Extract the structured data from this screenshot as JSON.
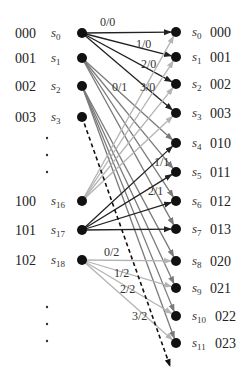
{
  "diagram": {
    "type": "trellis",
    "colors": {
      "node": "#111111",
      "black_edge": "#222222",
      "gray_edge": "#7a7a7a",
      "light_edge": "#b4b4b4",
      "dashed": "#111111"
    },
    "left_nodes": [
      {
        "code": "000",
        "name": "s",
        "sub": "0",
        "x": 82,
        "y": 33
      },
      {
        "code": "001",
        "name": "s",
        "sub": "1",
        "x": 82,
        "y": 58
      },
      {
        "code": "002",
        "name": "s",
        "sub": "2",
        "x": 82,
        "y": 86
      },
      {
        "code": "003",
        "name": "s",
        "sub": "3",
        "x": 82,
        "y": 117
      },
      {
        "code": "100",
        "name": "s",
        "sub": "16",
        "x": 82,
        "y": 201
      },
      {
        "code": "101",
        "name": "s",
        "sub": "17",
        "x": 82,
        "y": 230
      },
      {
        "code": "102",
        "name": "s",
        "sub": "18",
        "x": 82,
        "y": 260
      }
    ],
    "right_nodes": [
      {
        "code": "000",
        "name": "s",
        "sub": "0",
        "x": 176,
        "y": 32
      },
      {
        "code": "001",
        "name": "s",
        "sub": "1",
        "x": 176,
        "y": 57
      },
      {
        "code": "002",
        "name": "s",
        "sub": "2",
        "x": 176,
        "y": 84
      },
      {
        "code": "003",
        "name": "s",
        "sub": "3",
        "x": 176,
        "y": 113
      },
      {
        "code": "010",
        "name": "s",
        "sub": "4",
        "x": 176,
        "y": 143
      },
      {
        "code": "011",
        "name": "s",
        "sub": "5",
        "x": 176,
        "y": 172
      },
      {
        "code": "012",
        "name": "s",
        "sub": "6",
        "x": 176,
        "y": 201
      },
      {
        "code": "013",
        "name": "s",
        "sub": "7",
        "x": 176,
        "y": 229
      },
      {
        "code": "020",
        "name": "s",
        "sub": "8",
        "x": 176,
        "y": 261
      },
      {
        "code": "021",
        "name": "s",
        "sub": "9",
        "x": 176,
        "y": 288
      },
      {
        "code": "022",
        "name": "s",
        "sub": "10",
        "x": 176,
        "y": 316
      },
      {
        "code": "023",
        "name": "s",
        "sub": "11",
        "x": 176,
        "y": 343
      }
    ],
    "edge_groups": [
      {
        "from": 0,
        "to": [
          0,
          1,
          2,
          3
        ],
        "style": "black_edge"
      },
      {
        "from": 1,
        "to": [
          4,
          5,
          6,
          7
        ],
        "style": "gray_edge"
      },
      {
        "from": 2,
        "to": [
          8,
          9,
          10,
          11
        ],
        "style": "gray_edge"
      },
      {
        "from": 4,
        "to": [
          0,
          1,
          2,
          3
        ],
        "style": "light_edge"
      },
      {
        "from": 5,
        "to": [
          4,
          5,
          6,
          7
        ],
        "style": "black_edge"
      },
      {
        "from": 6,
        "to": [
          8,
          9,
          10,
          11
        ],
        "style": "light_edge"
      }
    ],
    "edge_labels": [
      {
        "text": "0/0",
        "x": 100,
        "y": 26
      },
      {
        "text": "1/0",
        "x": 136,
        "y": 48
      },
      {
        "text": "2/0",
        "x": 141,
        "y": 68
      },
      {
        "text": "3/0",
        "x": 140,
        "y": 91
      },
      {
        "text": "0/1",
        "x": 112,
        "y": 91
      },
      {
        "text": "1/1",
        "x": 154,
        "y": 166
      },
      {
        "text": "2/1",
        "x": 148,
        "y": 195
      },
      {
        "text": "0/2",
        "x": 104,
        "y": 256
      },
      {
        "text": "1/2",
        "x": 114,
        "y": 277
      },
      {
        "text": "2/2",
        "x": 120,
        "y": 293
      },
      {
        "text": "3/2",
        "x": 132,
        "y": 320
      }
    ],
    "ellipsis_left": [
      {
        "x": 47,
        "y": 138
      },
      {
        "x": 47,
        "y": 155
      },
      {
        "x": 47,
        "y": 172
      },
      {
        "x": 47,
        "y": 307
      },
      {
        "x": 47,
        "y": 324
      },
      {
        "x": 47,
        "y": 341
      }
    ],
    "dashed_arrow": {
      "x1": 82,
      "y1": 117,
      "x2": 170,
      "y2": 366
    }
  }
}
